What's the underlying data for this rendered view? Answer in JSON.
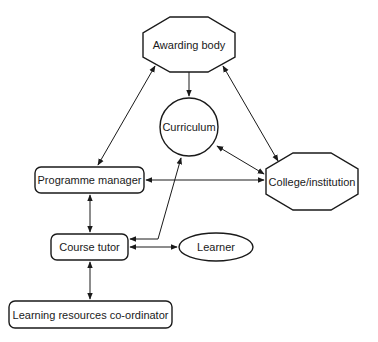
{
  "diagram": {
    "type": "relationship-diagram",
    "nodes": {
      "awarding_body": {
        "label": "Awarding body",
        "shape": "octagon"
      },
      "curriculum": {
        "label": "Curriculum",
        "shape": "circle"
      },
      "programme_manager": {
        "label": "Programme manager",
        "shape": "rounded-rect"
      },
      "college_institution": {
        "label": "College/institution",
        "shape": "octagon"
      },
      "course_tutor": {
        "label": "Course tutor",
        "shape": "rounded-rect"
      },
      "learner": {
        "label": "Learner",
        "shape": "ellipse"
      },
      "learning_resources_coordinator": {
        "label": "Learning resources co-ordinator",
        "shape": "rounded-rect"
      }
    },
    "edges": [
      {
        "from": "Awarding body",
        "to": "Curriculum",
        "direction": "one-way"
      },
      {
        "from": "Awarding body",
        "to": "Programme manager",
        "direction": "both"
      },
      {
        "from": "Awarding body",
        "to": "College/institution",
        "direction": "both"
      },
      {
        "from": "Curriculum",
        "to": "College/institution",
        "direction": "both"
      },
      {
        "from": "Programme manager",
        "to": "College/institution",
        "direction": "both"
      },
      {
        "from": "Programme manager",
        "to": "Course tutor",
        "direction": "both"
      },
      {
        "from": "Course tutor",
        "to": "Curriculum",
        "direction": "both"
      },
      {
        "from": "Course tutor",
        "to": "Learner",
        "direction": "both"
      },
      {
        "from": "Course tutor",
        "to": "Learning resources co-ordinator",
        "direction": "both"
      }
    ]
  }
}
